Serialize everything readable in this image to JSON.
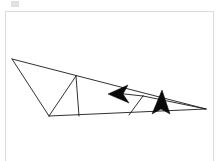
{
  "page": {
    "background_color": "#ffffff",
    "width": 220,
    "height": 161
  },
  "corner_mark": {
    "name": "faint-gray-mark",
    "color": "#c9c9c9"
  },
  "frame": {
    "name": "canvas-frame",
    "border_color": "#dcdcdc"
  },
  "figure": {
    "stroke_color": "#1a1a1a",
    "fill_color": "#0a0a0a",
    "vertices": {
      "left_apex": [
        11,
        58
      ],
      "bottom_left": [
        48,
        115
      ],
      "top_mid": [
        75,
        75
      ],
      "bottom_mid": [
        78,
        115
      ],
      "right_apex": [
        205,
        108
      ],
      "inner_right": [
        142,
        95
      ],
      "inner_bottom": [
        128,
        114
      ]
    },
    "segments": [
      {
        "name": "upper-long-edge",
        "points": "11,58 205,108"
      },
      {
        "name": "left-lower-edge",
        "points": "11,58 48,115"
      },
      {
        "name": "bottom-long-edge",
        "points": "48,115 205,108"
      },
      {
        "name": "left-diagonal-to-topmid",
        "points": "48,115 75,75"
      },
      {
        "name": "vertical-divider",
        "points": "75,75 78,115"
      },
      {
        "name": "inner-diagonal-right",
        "points": "142,95 128,114"
      },
      {
        "name": "inner-chord-upper",
        "points": "142,95 205,108"
      },
      {
        "name": "arrow-shaft-left",
        "points": "142,95 112,92"
      }
    ],
    "markers": [
      {
        "name": "left-pointing-arrowhead",
        "direction": "left",
        "polygon": "108,93 126,85 122,93 127,101"
      },
      {
        "name": "up-pointing-arrowhead",
        "direction": "up",
        "polygon": "160,90 168,112 160,108 152,112"
      }
    ]
  }
}
